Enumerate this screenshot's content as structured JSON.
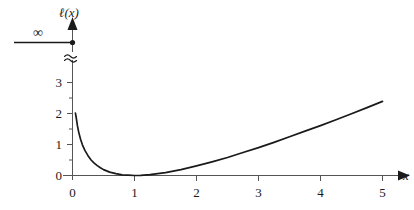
{
  "chart_data": {
    "type": "line",
    "title": "",
    "xlabel": "x",
    "ylabel": "ℓ(x)",
    "xlim": [
      -0.15,
      5.55
    ],
    "ylim": [
      -0.12,
      3.45
    ],
    "grid": false,
    "legend": "none",
    "function": "ℓ(x) = x - ln(x) - 1",
    "x_ticks": [
      {
        "value": 0,
        "label": "0"
      },
      {
        "value": 1,
        "label": "1"
      },
      {
        "value": 2,
        "label": "2"
      },
      {
        "value": 3,
        "label": "3"
      },
      {
        "value": 4,
        "label": "4"
      },
      {
        "value": 5,
        "label": "5"
      }
    ],
    "y_ticks": [
      {
        "value": 0,
        "label": "0"
      },
      {
        "value": 1,
        "label": "1"
      },
      {
        "value": 2,
        "label": "2"
      },
      {
        "value": 3,
        "label": "3"
      }
    ],
    "y_minor_ticks": [
      0.5,
      1.5,
      2.5
    ],
    "series": [
      {
        "name": "ℓ(x)",
        "color": "#1a1a1a",
        "x": [
          0.047,
          0.06,
          0.08,
          0.1,
          0.13,
          0.16,
          0.2,
          0.25,
          0.3,
          0.35,
          0.4,
          0.45,
          0.5,
          0.6,
          0.7,
          0.8,
          0.9,
          1.0,
          1.1,
          1.25,
          1.5,
          1.75,
          2.0,
          2.25,
          2.5,
          2.75,
          3.0,
          3.25,
          3.5,
          3.75,
          4.0,
          4.25,
          4.5,
          4.75,
          5.0
        ],
        "y": [
          2.01,
          1.87,
          1.6,
          1.4,
          1.17,
          0.99,
          0.81,
          0.64,
          0.5,
          0.4,
          0.32,
          0.25,
          0.19,
          0.11,
          0.06,
          0.02,
          0.01,
          0.0,
          0.005,
          0.027,
          0.095,
          0.19,
          0.31,
          0.44,
          0.58,
          0.74,
          0.9,
          1.07,
          1.25,
          1.43,
          1.61,
          1.8,
          1.99,
          2.19,
          2.39
        ]
      }
    ],
    "annotations": [
      {
        "name": "infinity-marker",
        "label": "∞",
        "description": "horizontal line with filled dot on y-axis marking the value at x=0"
      },
      {
        "name": "axis-break",
        "label": "≈",
        "description": "squiggle break in the y-axis between 3 and infinity"
      }
    ],
    "axis_arrow_heads": [
      "x-axis-right",
      "y-axis-top"
    ]
  },
  "labels": {
    "y_axis_title": "ℓ(x)",
    "x_axis_title": "x",
    "infinity": "∞",
    "x0": "0",
    "x1": "1",
    "x2": "2",
    "x3": "3",
    "x4": "4",
    "x5": "5",
    "y0": "0",
    "y1": "1",
    "y2": "2",
    "y3": "3"
  },
  "colors": {
    "curve": "#1a1a1a",
    "axis": "#555555",
    "text": "#1a1a1a",
    "background": "#ffffff"
  }
}
